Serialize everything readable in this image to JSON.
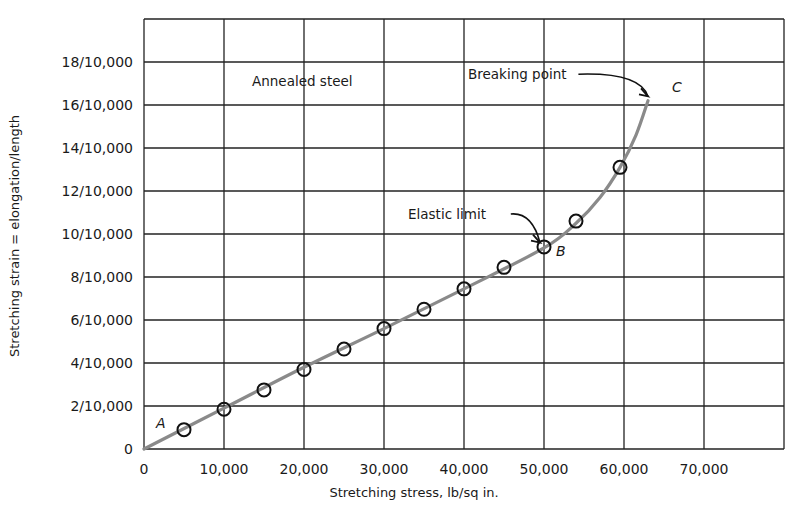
{
  "chart_data": {
    "type": "line",
    "title": "",
    "xlabel": "Stretching stress, lb/sq in.",
    "ylabel": "Stretching strain = elongation/length",
    "xlim": [
      0,
      80000
    ],
    "ylim": [
      0,
      20
    ],
    "y_unit_note": "y values expressed as numerator over 10,000",
    "grid": true,
    "x_ticks": [
      0,
      10000,
      20000,
      30000,
      40000,
      50000,
      60000,
      70000
    ],
    "x_tick_labels": [
      "0",
      "10,000",
      "20,000",
      "30,000",
      "40,000",
      "50,000",
      "60,000",
      "70,000"
    ],
    "y_ticks": [
      0,
      2,
      4,
      6,
      8,
      10,
      12,
      14,
      16,
      18
    ],
    "y_tick_labels": [
      "0",
      "2/10,000",
      "4/10,000",
      "6/10,000",
      "8/10,000",
      "10/10,000",
      "12/10,000",
      "14/10,000",
      "16/10,000",
      "18/10,000"
    ],
    "series": [
      {
        "name": "Annealed steel (measured points)",
        "marker": "open-circle",
        "x": [
          5000,
          10000,
          15000,
          20000,
          25000,
          30000,
          35000,
          40000,
          45000,
          50000,
          54000,
          59500
        ],
        "y": [
          0.9,
          1.85,
          2.75,
          3.7,
          4.65,
          5.6,
          6.5,
          7.45,
          8.45,
          9.4,
          10.6,
          13.1
        ]
      },
      {
        "name": "Annealed steel (fitted curve)",
        "marker": "none",
        "color": "#8a8a8a",
        "x": [
          0,
          10000,
          20000,
          30000,
          40000,
          50000,
          54000,
          57000,
          59500,
          61500,
          63000
        ],
        "y": [
          0,
          1.9,
          3.8,
          5.6,
          7.45,
          9.35,
          10.5,
          11.7,
          13.1,
          14.6,
          16.2
        ]
      }
    ],
    "annotations": [
      {
        "text": "Annealed steel",
        "x": 13500,
        "y": 16.9
      },
      {
        "text": "Elastic limit",
        "x": 33000,
        "y": 10.7,
        "arrow_to": [
          49500,
          9.6
        ]
      },
      {
        "text": "Breaking point",
        "x": 40500,
        "y": 17.2,
        "arrow_to": [
          63000,
          16.4
        ]
      }
    ],
    "point_labels": [
      {
        "text": "A",
        "x": 1500,
        "y": 1.0
      },
      {
        "text": "B",
        "x": 51500,
        "y": 9.0
      },
      {
        "text": "C",
        "x": 66000,
        "y": 16.6
      }
    ]
  }
}
